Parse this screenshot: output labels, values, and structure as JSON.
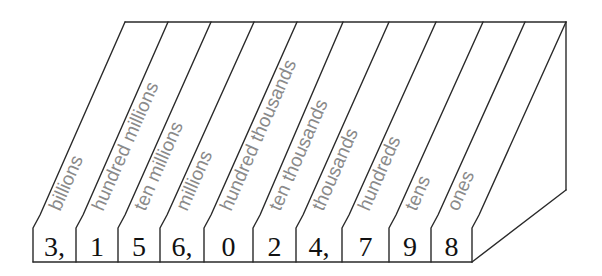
{
  "diagram": {
    "number": "3,156,024,798",
    "columns": [
      {
        "place": "billions",
        "digit": "3,"
      },
      {
        "place": "hundred millions",
        "digit": "1"
      },
      {
        "place": "ten millions",
        "digit": "5"
      },
      {
        "place": "millions",
        "digit": "6,"
      },
      {
        "place": "hundred thousands",
        "digit": "0"
      },
      {
        "place": "ten thousands",
        "digit": "2"
      },
      {
        "place": "thousands",
        "digit": "4,"
      },
      {
        "place": "hundreds",
        "digit": "7"
      },
      {
        "place": "tens",
        "digit": "9"
      },
      {
        "place": "ones",
        "digit": "8"
      }
    ],
    "colors": {
      "line": "#2a2a2a",
      "label": "#8a8a8a",
      "digit": "#111111",
      "background": "#ffffff"
    }
  }
}
